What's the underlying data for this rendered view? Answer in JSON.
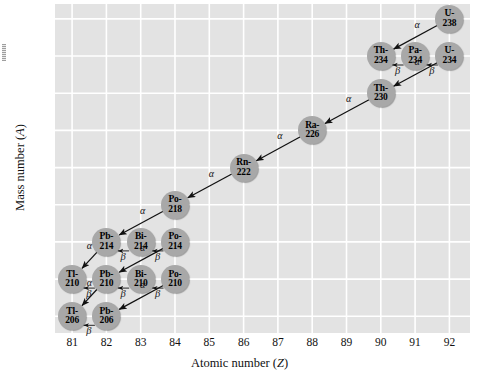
{
  "chart_data": {
    "type": "scatter",
    "title": "",
    "xlabel": "Atomic number (Z)",
    "ylabel": "Mass number (A)",
    "xlim": [
      80.5,
      92.6
    ],
    "ylim": [
      204.2,
      239.6
    ],
    "xticks": [
      81,
      82,
      83,
      84,
      85,
      86,
      87,
      88,
      89,
      90,
      91,
      92
    ],
    "yticks": [
      206,
      210,
      214,
      218,
      222,
      226,
      230,
      234,
      238
    ],
    "grid": true,
    "legend": "none",
    "nodes": [
      {
        "label": "U-238",
        "name": "U-",
        "mass": "238",
        "z": 92,
        "a": 238
      },
      {
        "label": "Th-234",
        "name": "Th-",
        "mass": "234",
        "z": 90,
        "a": 234
      },
      {
        "label": "Pa-234",
        "name": "Pa-",
        "mass": "234",
        "z": 91,
        "a": 234
      },
      {
        "label": "U-234",
        "name": "U-",
        "mass": "234",
        "z": 92,
        "a": 234
      },
      {
        "label": "Th-230",
        "name": "Th-",
        "mass": "230",
        "z": 90,
        "a": 230
      },
      {
        "label": "Ra-226",
        "name": "Ra-",
        "mass": "226",
        "z": 88,
        "a": 226
      },
      {
        "label": "Rn-222",
        "name": "Rn-",
        "mass": "222",
        "z": 86,
        "a": 222
      },
      {
        "label": "Po-218",
        "name": "Po-",
        "mass": "218",
        "z": 84,
        "a": 218
      },
      {
        "label": "Pb-214",
        "name": "Pb-",
        "mass": "214",
        "z": 82,
        "a": 214
      },
      {
        "label": "Bi-214",
        "name": "Bi-",
        "mass": "214",
        "z": 83,
        "a": 214
      },
      {
        "label": "Po-214",
        "name": "Po-",
        "mass": "214",
        "z": 84,
        "a": 214
      },
      {
        "label": "Tl-210",
        "name": "Tl-",
        "mass": "210",
        "z": 81,
        "a": 210
      },
      {
        "label": "Pb-210",
        "name": "Pb-",
        "mass": "210",
        "z": 82,
        "a": 210
      },
      {
        "label": "Bi-210",
        "name": "Bi-",
        "mass": "210",
        "z": 83,
        "a": 210
      },
      {
        "label": "Po-210",
        "name": "Po-",
        "mass": "210",
        "z": 84,
        "a": 210
      },
      {
        "label": "Tl-206",
        "name": "Tl-",
        "mass": "206",
        "z": 81,
        "a": 206
      },
      {
        "label": "Pb-206",
        "name": "Pb-",
        "mass": "206",
        "z": 82,
        "a": 206
      }
    ],
    "decays": [
      {
        "from": "U-238",
        "to": "Th-234",
        "mode": "alpha",
        "symbol": "α"
      },
      {
        "from": "U-234",
        "to": "Pa-234",
        "mode": "beta",
        "symbol": "β"
      },
      {
        "from": "Pa-234",
        "to": "Th-234",
        "mode": "beta",
        "symbol": "β"
      },
      {
        "from": "U-234",
        "to": "Th-230",
        "mode": "alpha",
        "symbol": "α"
      },
      {
        "from": "Th-230",
        "to": "Ra-226",
        "mode": "alpha",
        "symbol": "α"
      },
      {
        "from": "Ra-226",
        "to": "Rn-222",
        "mode": "alpha",
        "symbol": "α"
      },
      {
        "from": "Rn-222",
        "to": "Po-218",
        "mode": "alpha",
        "symbol": "α"
      },
      {
        "from": "Po-218",
        "to": "Pb-214",
        "mode": "alpha",
        "symbol": "α"
      },
      {
        "from": "Po-214",
        "to": "Bi-214",
        "mode": "beta",
        "symbol": "β"
      },
      {
        "from": "Bi-214",
        "to": "Pb-214",
        "mode": "beta",
        "symbol": "β"
      },
      {
        "from": "Po-214",
        "to": "Pb-210",
        "mode": "alpha",
        "symbol": "α"
      },
      {
        "from": "Pb-214",
        "to": "Tl-210",
        "mode": "alpha",
        "symbol": "α"
      },
      {
        "from": "Po-210",
        "to": "Bi-210",
        "mode": "beta",
        "symbol": "β"
      },
      {
        "from": "Bi-210",
        "to": "Pb-210",
        "mode": "beta",
        "symbol": "β"
      },
      {
        "from": "Pb-210",
        "to": "Tl-206",
        "mode": "alpha",
        "symbol": "α"
      },
      {
        "from": "Po-210",
        "to": "Pb-206",
        "mode": "alpha",
        "symbol": "α"
      },
      {
        "from": "Pb-210",
        "to": "Tl-210",
        "mode": "beta",
        "symbol": "β"
      },
      {
        "from": "Pb-206",
        "to": "Tl-206",
        "mode": "beta",
        "symbol": "β"
      }
    ],
    "colors": {
      "plot_background": "#e3e3e3",
      "gridline": "#ffffff",
      "node_fill": "#a8a8a8",
      "arrow": "#111111",
      "text": "#111111"
    }
  }
}
